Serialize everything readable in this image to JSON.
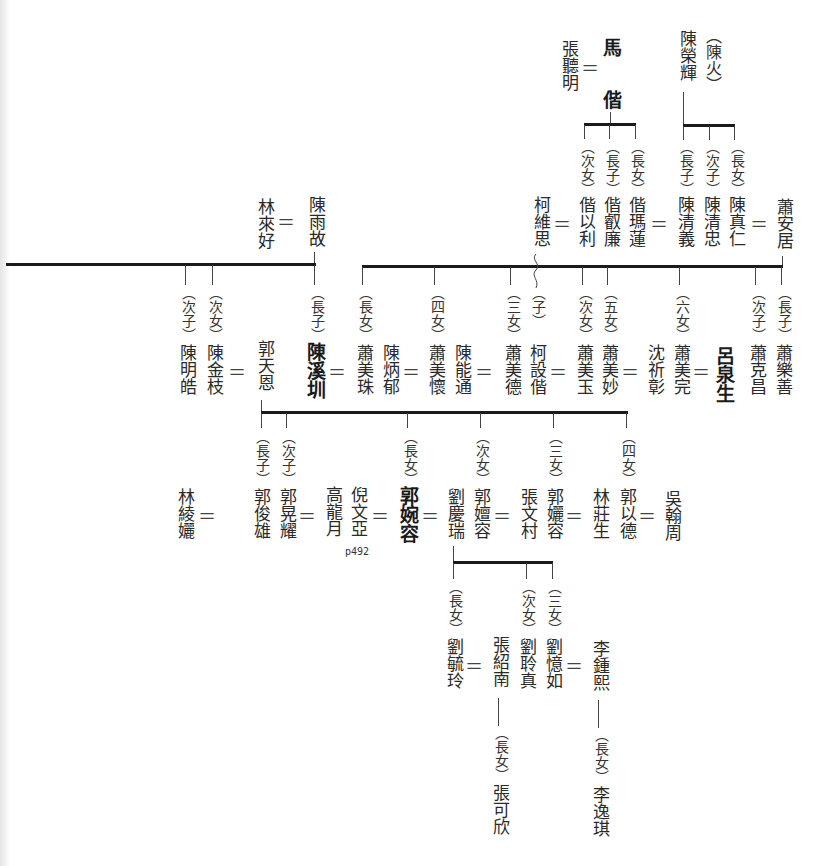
{
  "diagram": {
    "type": "family-tree",
    "gen1": {
      "ma_couple": {
        "spouse": "張聽明",
        "person_1": "馬",
        "person_2": "偕",
        "eq": "＝"
      },
      "chen_rong_hui": {
        "name": "陳榮輝",
        "alias": "（陳火）"
      },
      "ma_children": [
        {
          "rel": "（次女）",
          "name": "偕以利"
        },
        {
          "rel": "（長子）",
          "name": "偕叡廉"
        },
        {
          "rel": "（長女）",
          "name": "偕瑪蓮"
        }
      ],
      "chen_children": [
        {
          "rel": "（長子）",
          "name": "陳清義"
        },
        {
          "rel": "（次子）",
          "name": "陳清忠"
        },
        {
          "rel": "（長女）",
          "name": "陳真仁"
        }
      ],
      "ke_wei_si": "柯維思",
      "xiao_an_ju": "蕭安居",
      "lin_lai_hao": "林來好",
      "chen_yu_gu": "陳雨故"
    },
    "gen2": [
      {
        "rel": "（次子）",
        "name": "陳明皓"
      },
      {
        "rel": "（次女）",
        "name": "陳金枝"
      },
      {
        "name": "郭天恩"
      },
      {
        "rel": "（長子）",
        "name": "陳溪圳",
        "emphasis": true
      },
      {
        "rel": "（長女）",
        "name": "蕭美珠"
      },
      {
        "name": "陳炳郁"
      },
      {
        "rel": "（四女）",
        "name": "蕭美懷"
      },
      {
        "name": "陳能通"
      },
      {
        "rel": "（三女）",
        "name": "蕭美德"
      },
      {
        "rel": "（子）",
        "name": "柯設偕"
      },
      {
        "rel": "（次女）",
        "name": "蕭美玉"
      },
      {
        "rel": "（五女）",
        "name": "蕭美妙"
      },
      {
        "name": "沈祈彰"
      },
      {
        "rel": "（六女）",
        "name": "蕭美完"
      },
      {
        "name": "呂泉生",
        "emphasis": true
      },
      {
        "rel": "（次子）",
        "name": "蕭克昌"
      },
      {
        "rel": "（長子）",
        "name": "蕭樂善"
      }
    ],
    "gen3": [
      {
        "name": "林綾孋"
      },
      {
        "rel": "（長子）",
        "name": "郭俊雄"
      },
      {
        "rel": "（次子）",
        "name": "郭晃耀"
      },
      {
        "name": "高龍月"
      },
      {
        "name": "倪文亞",
        "note": "p492"
      },
      {
        "rel": "（長女）",
        "name": "郭婉容",
        "emphasis": true
      },
      {
        "name": "劉慶瑞"
      },
      {
        "rel": "（次女）",
        "name": "郭嬗容"
      },
      {
        "name": "張文村"
      },
      {
        "rel": "（三女）",
        "name": "郭孋容"
      },
      {
        "name": "林莊生"
      },
      {
        "rel": "（四女）",
        "name": "郭以德"
      },
      {
        "name": "吳翰周"
      }
    ],
    "gen4": [
      {
        "rel": "（長女）",
        "name": "劉毓玲"
      },
      {
        "name": "張紹南"
      },
      {
        "rel": "（次女）",
        "name": "劉聆真"
      },
      {
        "rel": "（三女）",
        "name": "劉憶如"
      },
      {
        "name": "李鍾熙"
      }
    ],
    "gen5": [
      {
        "rel": "（長女）",
        "name": "張可欣"
      },
      {
        "rel": "（長女）",
        "name": "李逸琪"
      }
    ],
    "marriage_symbol": "＝"
  }
}
